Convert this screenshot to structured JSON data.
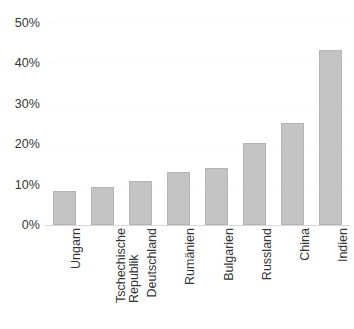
{
  "chart_data": {
    "type": "bar",
    "title": "",
    "subtitle": "",
    "xlabel": "",
    "ylabel": "",
    "categories": [
      "Ungarn",
      "Tschechische\nRepublik",
      "Deutschland",
      "Rumänien",
      "Bulgarien",
      "Russland",
      "China",
      "Indien"
    ],
    "values": [
      8.5,
      9.3,
      11.0,
      13.2,
      14.1,
      20.3,
      25.3,
      43.2
    ],
    "ylim": [
      0,
      50
    ],
    "yticks": [
      0,
      10,
      20,
      30,
      40,
      50
    ],
    "ytick_labels": [
      "0%",
      "10%",
      "20%",
      "30%",
      "40%",
      "50%"
    ],
    "grid": true,
    "legend": false,
    "units": "percent",
    "bar_color": "#c4c4c4",
    "bar_border_color": "#b4b4b4",
    "axis_text_color": "#353535",
    "gridline_color": "#fbfbfb",
    "baseline_color": "#d8d8d8"
  }
}
